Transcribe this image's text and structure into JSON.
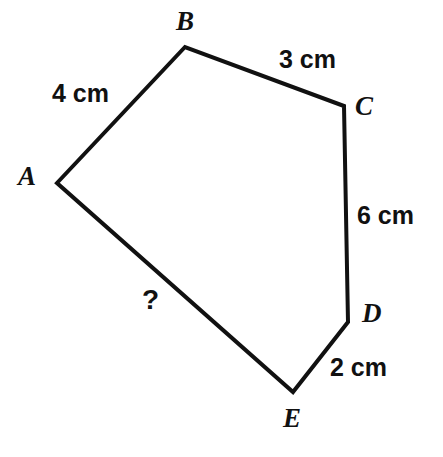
{
  "figure": {
    "type": "polygon",
    "name": "pentagon-abcde",
    "background_color": "#ffffff",
    "stroke_color": "#111111",
    "stroke_width": 4,
    "vertices": [
      {
        "id": "A",
        "x": 57,
        "y": 183
      },
      {
        "id": "B",
        "x": 185,
        "y": 47
      },
      {
        "id": "C",
        "x": 344,
        "y": 106
      },
      {
        "id": "D",
        "x": 348,
        "y": 322
      },
      {
        "id": "E",
        "x": 293,
        "y": 392
      }
    ],
    "path": "M 57 183 L 185 47 L 344 106 L 348 322 L 293 392 Z"
  },
  "vertex_labels": [
    {
      "id": "A",
      "text": "A",
      "x": 18,
      "y": 163
    },
    {
      "id": "B",
      "text": "B",
      "x": 176,
      "y": 8
    },
    {
      "id": "C",
      "text": "C",
      "x": 355,
      "y": 93
    },
    {
      "id": "D",
      "text": "D",
      "x": 362,
      "y": 300
    },
    {
      "id": "E",
      "text": "E",
      "x": 283,
      "y": 405
    }
  ],
  "side_labels": [
    {
      "id": "AB",
      "text": "4 cm",
      "x": 52,
      "y": 81,
      "side": "A-B"
    },
    {
      "id": "BC",
      "text": "3 cm",
      "x": 279,
      "y": 47,
      "side": "B-C"
    },
    {
      "id": "CD",
      "text": "6 cm",
      "x": 357,
      "y": 203,
      "side": "C-D"
    },
    {
      "id": "DE",
      "text": "2 cm",
      "x": 330,
      "y": 355,
      "side": "D-E"
    },
    {
      "id": "EA",
      "text": "?",
      "x": 142,
      "y": 286,
      "side": "E-A"
    }
  ]
}
